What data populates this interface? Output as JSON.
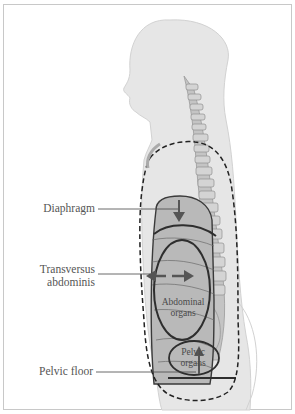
{
  "figure": {
    "type": "anatomical-diagram",
    "colors": {
      "body": "#e6e6e6",
      "body_edge": "#cfcfcf",
      "spine": "#bdbdbd",
      "organ_fill": "#b7b7b7",
      "outline": "#3a3a3a",
      "dashed": "#222222",
      "frame": "#c8c8c8",
      "label_text": "#555555"
    }
  },
  "labels": {
    "diaphragm": "Diaphragm",
    "transversus_line1": "Transversus",
    "transversus_line2": "abdominis",
    "pelvic_floor": "Pelvic floor"
  },
  "organ_labels": {
    "abdominal_line1": "Abdominal",
    "abdominal_line2": "organs",
    "pelvic_line1": "Pelvic",
    "pelvic_line2": "organs"
  }
}
